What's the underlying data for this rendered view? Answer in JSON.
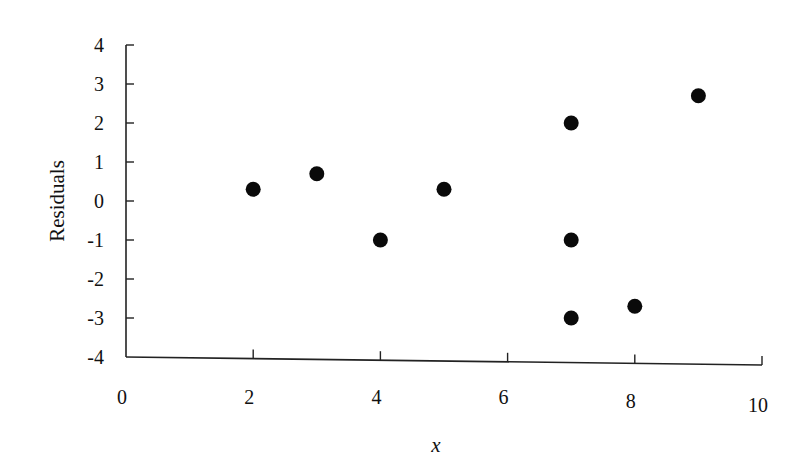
{
  "chart_data": {
    "type": "scatter",
    "title": "",
    "xlabel": "x",
    "ylabel": "Residuals",
    "xlim": [
      0,
      10
    ],
    "ylim": [
      -4,
      4
    ],
    "x_ticks": [
      0,
      2,
      4,
      6,
      8,
      10
    ],
    "y_ticks": [
      4,
      3,
      2,
      1,
      0,
      -1,
      -2,
      -3,
      -4
    ],
    "grid": false,
    "legend": null,
    "series": [
      {
        "name": "Residuals",
        "marker": "filled-circle",
        "color": "#0a0a0a",
        "points": [
          {
            "x": 2,
            "y": 0.3
          },
          {
            "x": 3,
            "y": 0.7
          },
          {
            "x": 4,
            "y": -1
          },
          {
            "x": 5,
            "y": 0.3
          },
          {
            "x": 7,
            "y": 2
          },
          {
            "x": 7,
            "y": -1
          },
          {
            "x": 7,
            "y": -3
          },
          {
            "x": 8,
            "y": -2.7
          },
          {
            "x": 9,
            "y": 2.7
          }
        ]
      }
    ]
  },
  "labels": {
    "x_axis_title": "x",
    "y_axis_title": "Residuals"
  }
}
